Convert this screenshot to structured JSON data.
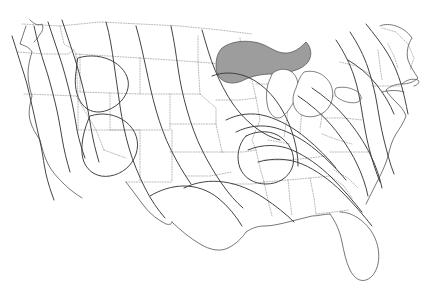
{
  "figure": {
    "kind": "contour-map",
    "region": "Contiguous United States",
    "title": "",
    "subtitle": "",
    "legend": "",
    "labels_present": "none",
    "background_color": "#ffffff",
    "width": 440,
    "height": 302
  },
  "style": {
    "state_border_color": "#9b9b9b",
    "state_border_pattern": "dotted",
    "coastline_color": "#4a4a4a",
    "contour_color": "#3a3a3a",
    "shaded_region_fill": "#9d9d9d",
    "lake_outline_fill": "#ffffff"
  },
  "chart_data": {
    "type": "line",
    "title": "",
    "xlabel": "",
    "ylabel": "",
    "grid": false,
    "legend_position": "none",
    "annotations": [],
    "series": [
      {
        "name": "pacific-coast-isoline-outer",
        "path": "M 12 36 C 16 48 20 62 24 74 C 28 86 30 98 33 110 C 36 122 38 134 41 146 C 43 156 44 165 46 174 C 48 183 51 192 54 200"
      },
      {
        "name": "pacific-coast-isoline-mid",
        "path": "M 30 28 C 33 40 37 54 41 66 C 45 78 48 90 51 102 C 54 114 56 126 58 138 C 60 150 63 162 66 172"
      },
      {
        "name": "pacific-coast-isoline-inner",
        "path": "M 44 22 C 48 34 52 46 56 58 C 60 70 63 82 66 94 C 69 106 71 118 73 130 C 75 140 78 150 81 158"
      },
      {
        "name": "cascade-sierra-isoline",
        "path": "M 58 18 C 62 30 66 42 70 54 C 74 66 77 78 80 90 C 83 102 85 114 87 126 C 89 138 92 150 95 160"
      },
      {
        "name": "great-basin-closed-loop-north",
        "path": "M 78 58 C 90 54 104 56 114 62 C 124 68 130 78 128 88 C 126 98 118 106 108 110 C 98 114 88 112 82 104 C 76 96 74 84 76 72 Z"
      },
      {
        "name": "great-basin-closed-loop-south",
        "path": "M 88 114 C 100 110 114 112 124 120 C 134 128 138 140 134 152 C 130 164 120 172 108 174 C 96 176 86 170 82 160 C 78 150 80 136 84 124 Z"
      },
      {
        "name": "rockies-isoline-west",
        "path": "M 106 22 C 110 36 112 50 114 64 C 116 78 118 92 120 106 C 122 120 125 134 129 148 C 133 162 139 176 145 188 C 151 200 158 210 165 218"
      },
      {
        "name": "rockies-isoline-east",
        "path": "M 136 26 C 140 40 143 54 146 68 C 149 82 152 96 156 110 C 160 124 165 138 171 150 C 177 162 184 174 191 184"
      },
      {
        "name": "central-plains-isoline",
        "path": "M 171 26 C 174 40 176 54 178 68 C 180 82 183 96 187 110 C 191 124 196 138 202 150 C 208 162 215 174 222 184 C 229 194 236 202 243 208"
      },
      {
        "name": "midwest-isoline-north",
        "path": "M 202 30 C 206 44 210 58 215 70 C 220 82 226 94 233 104 C 240 114 248 122 256 128 C 264 134 272 138 280 140"
      },
      {
        "name": "great-lakes-south-isoline",
        "path": "M 212 74 C 222 70 234 70 245 74 C 256 78 266 86 274 96 C 282 106 288 118 292 130 C 296 142 298 154 298 164"
      },
      {
        "name": "ohio-valley-isoline-outer",
        "path": "M 226 120 C 238 114 252 112 266 116 C 280 120 294 128 306 138 C 318 148 328 158 336 168"
      },
      {
        "name": "ohio-valley-isoline-mid",
        "path": "M 236 132 C 248 126 262 124 276 128 C 290 132 304 140 316 150 C 328 160 338 170 346 180"
      },
      {
        "name": "appalachian-isoline-a",
        "path": "M 248 150 C 262 144 278 144 292 150 C 306 156 320 166 332 178 C 344 190 354 202 362 212"
      },
      {
        "name": "appalachian-isoline-b",
        "path": "M 258 162 C 272 158 288 158 302 164 C 316 170 330 180 342 192 C 354 204 364 216 372 226"
      },
      {
        "name": "appalachian-isoline-c",
        "path": "M 298 96 C 310 104 322 114 332 126 C 342 138 350 150 356 162 C 362 174 366 186 368 196"
      },
      {
        "name": "appalachian-isoline-d",
        "path": "M 312 88 C 324 96 336 106 346 118 C 356 130 364 142 370 154 C 376 166 380 178 382 188"
      },
      {
        "name": "atlantic-coast-isoline-outer",
        "path": "M 336 40 C 344 52 350 64 354 76 C 358 88 360 100 362 112 C 364 124 366 136 369 148 C 372 160 376 172 380 182"
      },
      {
        "name": "atlantic-coast-isoline-inner",
        "path": "M 350 32 C 358 44 364 56 368 68 C 372 80 375 92 377 104 C 379 116 381 128 384 140 C 387 152 390 164 394 174"
      },
      {
        "name": "northeast-isoline",
        "path": "M 366 24 C 374 34 382 44 388 54 C 394 64 398 74 401 84 C 404 94 406 104 408 114"
      },
      {
        "name": "gulf-coast-isoline",
        "path": "M 184 188 C 196 182 210 180 224 182 C 238 184 252 190 264 198 C 276 206 286 214 294 222"
      },
      {
        "name": "texas-oklahoma-isoline",
        "path": "M 150 196 C 160 190 172 186 184 186 C 196 186 208 190 218 198 C 228 206 236 216 242 226"
      }
    ],
    "shaded_regions": [
      {
        "name": "upper-great-lakes-shaded",
        "fill": "#9d9d9d",
        "approx_center_px": [
          255,
          58
        ],
        "description": "Gray filled polygon over Lake Superior and northern Lake Michigan / upper Michigan area"
      }
    ],
    "state_grid": {
      "style": "dotted",
      "color": "#9b9b9b",
      "description": "Interior state boundaries of the contiguous United States rendered as fine dotted lines"
    }
  }
}
